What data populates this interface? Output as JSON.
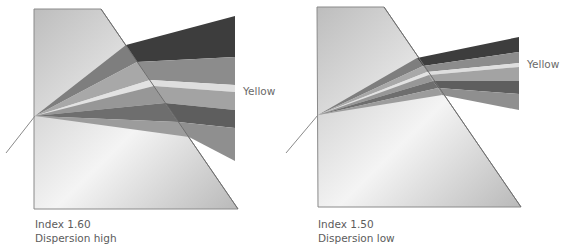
{
  "diagrams": [
    {
      "title": "High dispersion prism",
      "index_label": "Index 1.60",
      "dispersion_label": "Dispersion high",
      "band_label": "Yellow"
    },
    {
      "title": "Low dispersion prism",
      "index_label": "Index 1.50",
      "dispersion_label": "Dispersion low",
      "band_label": "Yellow"
    }
  ],
  "colors": {
    "prism_light": "#f2f2f2",
    "prism_dark": "#c4c4c4",
    "prism_edge": "#8a8a8a",
    "band_darkest": "#3d3d3d",
    "band_mid": "#8c8c8c",
    "band_yellow": "#dedede",
    "band_light": "#a3a3a3",
    "band_dark": "#5e5e5e",
    "band_lightmid": "#8f8f8f",
    "text": "#5c5c5c"
  }
}
